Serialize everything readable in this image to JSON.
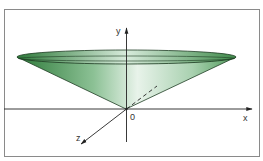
{
  "diagram": {
    "axes": {
      "x_label": "x",
      "y_label": "y",
      "z_label": "z",
      "origin_label": "0"
    },
    "colors": {
      "cone_dark": "#2e7a3a",
      "cone_light": "#e6f2e8",
      "frame": "#8a8a8a",
      "axis": "#222222"
    }
  }
}
